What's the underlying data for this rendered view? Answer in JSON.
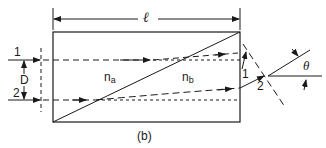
{
  "figure": {
    "caption": "(b)",
    "length_label": "ℓ",
    "separation_label": "D",
    "angle_label": "θ",
    "media": {
      "left": {
        "symbol": "n",
        "subscript": "a"
      },
      "right": {
        "symbol": "n",
        "subscript": "b"
      }
    },
    "rays": [
      {
        "id": "1",
        "input_label": "1",
        "output_label": "1"
      },
      {
        "id": "2",
        "input_label": "2",
        "output_label": "2"
      }
    ],
    "colors": {
      "stroke": "#1a1a1a",
      "background": "#ffffff"
    }
  }
}
